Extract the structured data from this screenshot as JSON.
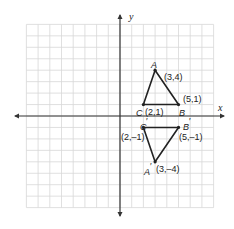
{
  "chart_data": {
    "type": "diagram",
    "title": "",
    "xlabel": "x",
    "ylabel": "y",
    "xlim": [
      -8,
      8
    ],
    "ylim": [
      -8,
      8
    ],
    "grid": true,
    "colors": {
      "grid": "#d8d8d8",
      "axis": "#333333",
      "triangle": "#222222",
      "background": "#ffffff"
    },
    "triangles": [
      {
        "name": "ABC",
        "vertices": [
          {
            "name": "A",
            "x": 3,
            "y": 4,
            "coord_label": "(3,4)"
          },
          {
            "name": "B",
            "x": 5,
            "y": 1,
            "coord_label": "(5,1)"
          },
          {
            "name": "C",
            "x": 2,
            "y": 1,
            "coord_label": "(2,1)"
          }
        ]
      },
      {
        "name": "A'B'C'",
        "vertices": [
          {
            "name": "A′",
            "x": 3,
            "y": -4,
            "coord_label": "(3,–4)"
          },
          {
            "name": "B′",
            "x": 5,
            "y": -1,
            "coord_label": "(5,–1)"
          },
          {
            "name": "C′",
            "x": 2,
            "y": -1,
            "coord_label": "(2,–1)"
          }
        ]
      }
    ]
  },
  "labels": {
    "x_axis": "x",
    "y_axis": "y",
    "A": "A",
    "B": "B",
    "C": "C",
    "A_coord": "(3,4)",
    "B_coord": "(5,1)",
    "C_coord": "(2,1)",
    "A2": "A",
    "B2": "B",
    "C2": "C",
    "A2_coord": "(3,–4)",
    "B2_coord": "(5,–1)",
    "C2_coord": "(2,–1)",
    "prime": "′"
  }
}
